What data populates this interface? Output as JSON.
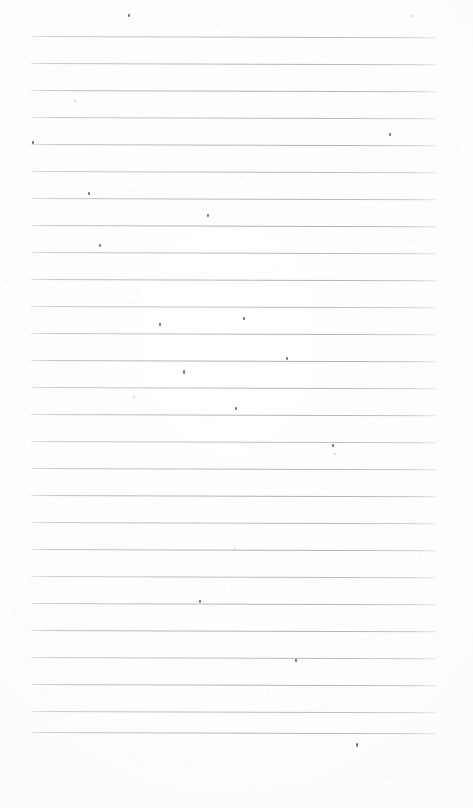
{
  "document": {
    "kind": "scanned-paper",
    "description": "Blank ruled writing paper, scanned",
    "text_content": "",
    "page_width": 473,
    "page_height": 808,
    "background_color": "#fdfdfd",
    "rule_color": "#b4b4bc",
    "ink_color": "#4a4a52"
  },
  "ruling": {
    "line_count": 26,
    "first_line_y": 36,
    "line_spacing": 27,
    "line_left_x": 31,
    "line_right_x": 436,
    "line_thickness": 1,
    "skew_degrees": 0.18,
    "lines_y": [
      36,
      63,
      90,
      117,
      144,
      171,
      198,
      225,
      252,
      279,
      306,
      333,
      360,
      387,
      414,
      441,
      468,
      495,
      522,
      549,
      576,
      603,
      630,
      657,
      684,
      711,
      732
    ]
  },
  "margins": {
    "top_margin_height": 36,
    "bottom_margin_height": 76,
    "left_margin_width": 31,
    "right_margin_width": 37
  },
  "specks": [
    {
      "x": 128,
      "y": 14,
      "size": 2.0,
      "tone": "dark"
    },
    {
      "x": 216,
      "y": 24,
      "size": 1.4,
      "tone": "faint"
    },
    {
      "x": 246,
      "y": 10,
      "size": 1.3,
      "tone": "faint"
    },
    {
      "x": 411,
      "y": 15,
      "size": 1.5,
      "tone": "faint"
    },
    {
      "x": 457,
      "y": 22,
      "size": 1.2,
      "tone": "faint"
    },
    {
      "x": 67,
      "y": 44,
      "size": 1.4,
      "tone": "faint"
    },
    {
      "x": 289,
      "y": 41,
      "size": 1.3,
      "tone": "faint"
    },
    {
      "x": 380,
      "y": 62,
      "size": 1.4,
      "tone": "faint"
    },
    {
      "x": 76,
      "y": 56,
      "size": 1.3,
      "tone": "faint"
    },
    {
      "x": 270,
      "y": 73,
      "size": 1.3,
      "tone": "faint"
    },
    {
      "x": 74,
      "y": 100,
      "size": 1.5,
      "tone": "faint"
    },
    {
      "x": 372,
      "y": 89,
      "size": 1.3,
      "tone": "faint"
    },
    {
      "x": 136,
      "y": 113,
      "size": 1.2,
      "tone": "faint"
    },
    {
      "x": 389,
      "y": 133,
      "size": 1.8,
      "tone": "dark"
    },
    {
      "x": 32,
      "y": 141,
      "size": 1.6,
      "tone": "dark"
    },
    {
      "x": 158,
      "y": 146,
      "size": 1.3,
      "tone": "faint"
    },
    {
      "x": 342,
      "y": 154,
      "size": 1.2,
      "tone": "faint"
    },
    {
      "x": 457,
      "y": 147,
      "size": 1.3,
      "tone": "faint"
    },
    {
      "x": 13,
      "y": 174,
      "size": 1.4,
      "tone": "faint"
    },
    {
      "x": 240,
      "y": 176,
      "size": 1.2,
      "tone": "faint"
    },
    {
      "x": 88,
      "y": 192,
      "size": 1.9,
      "tone": "dark"
    },
    {
      "x": 130,
      "y": 190,
      "size": 1.3,
      "tone": "faint"
    },
    {
      "x": 303,
      "y": 193,
      "size": 1.3,
      "tone": "faint"
    },
    {
      "x": 207,
      "y": 214,
      "size": 1.8,
      "tone": "dark"
    },
    {
      "x": 174,
      "y": 203,
      "size": 1.2,
      "tone": "faint"
    },
    {
      "x": 413,
      "y": 240,
      "size": 1.4,
      "tone": "faint"
    },
    {
      "x": 99,
      "y": 244,
      "size": 1.8,
      "tone": "dark"
    },
    {
      "x": 276,
      "y": 267,
      "size": 1.4,
      "tone": "faint"
    },
    {
      "x": 160,
      "y": 272,
      "size": 1.3,
      "tone": "faint"
    },
    {
      "x": 7,
      "y": 280,
      "size": 1.3,
      "tone": "faint"
    },
    {
      "x": 36,
      "y": 299,
      "size": 1.4,
      "tone": "faint"
    },
    {
      "x": 136,
      "y": 291,
      "size": 1.2,
      "tone": "faint"
    },
    {
      "x": 133,
      "y": 303,
      "size": 1.3,
      "tone": "faint"
    },
    {
      "x": 243,
      "y": 317,
      "size": 1.9,
      "tone": "dark"
    },
    {
      "x": 159,
      "y": 323,
      "size": 1.6,
      "tone": "dark"
    },
    {
      "x": 337,
      "y": 315,
      "size": 1.3,
      "tone": "faint"
    },
    {
      "x": 286,
      "y": 357,
      "size": 1.9,
      "tone": "dark"
    },
    {
      "x": 183,
      "y": 370,
      "size": 2.2,
      "tone": "dark"
    },
    {
      "x": 121,
      "y": 379,
      "size": 1.4,
      "tone": "faint"
    },
    {
      "x": 355,
      "y": 365,
      "size": 1.3,
      "tone": "faint"
    },
    {
      "x": 133,
      "y": 396,
      "size": 1.5,
      "tone": "faint"
    },
    {
      "x": 235,
      "y": 407,
      "size": 2.0,
      "tone": "dark"
    },
    {
      "x": 236,
      "y": 412,
      "size": 1.4,
      "tone": "faint"
    },
    {
      "x": 332,
      "y": 444,
      "size": 2.0,
      "tone": "dark"
    },
    {
      "x": 334,
      "y": 453,
      "size": 1.5,
      "tone": "faint"
    },
    {
      "x": 53,
      "y": 450,
      "size": 1.3,
      "tone": "faint"
    },
    {
      "x": 416,
      "y": 443,
      "size": 1.2,
      "tone": "faint"
    },
    {
      "x": 86,
      "y": 483,
      "size": 1.3,
      "tone": "faint"
    },
    {
      "x": 348,
      "y": 481,
      "size": 1.4,
      "tone": "faint"
    },
    {
      "x": 375,
      "y": 481,
      "size": 1.2,
      "tone": "faint"
    },
    {
      "x": 345,
      "y": 500,
      "size": 1.3,
      "tone": "faint"
    },
    {
      "x": 18,
      "y": 506,
      "size": 1.3,
      "tone": "faint"
    },
    {
      "x": 133,
      "y": 518,
      "size": 1.2,
      "tone": "faint"
    },
    {
      "x": 234,
      "y": 548,
      "size": 1.5,
      "tone": "faint"
    },
    {
      "x": 84,
      "y": 562,
      "size": 1.4,
      "tone": "faint"
    },
    {
      "x": 135,
      "y": 564,
      "size": 1.2,
      "tone": "faint"
    },
    {
      "x": 419,
      "y": 559,
      "size": 1.3,
      "tone": "faint"
    },
    {
      "x": 199,
      "y": 600,
      "size": 1.9,
      "tone": "dark"
    },
    {
      "x": 268,
      "y": 603,
      "size": 1.3,
      "tone": "faint"
    },
    {
      "x": 300,
      "y": 593,
      "size": 1.2,
      "tone": "faint"
    },
    {
      "x": 15,
      "y": 611,
      "size": 1.3,
      "tone": "faint"
    },
    {
      "x": 373,
      "y": 621,
      "size": 1.4,
      "tone": "faint"
    },
    {
      "x": 96,
      "y": 658,
      "size": 1.4,
      "tone": "faint"
    },
    {
      "x": 164,
      "y": 667,
      "size": 1.3,
      "tone": "faint"
    },
    {
      "x": 295,
      "y": 659,
      "size": 1.9,
      "tone": "dark"
    },
    {
      "x": 41,
      "y": 691,
      "size": 1.3,
      "tone": "faint"
    },
    {
      "x": 267,
      "y": 695,
      "size": 1.2,
      "tone": "faint"
    },
    {
      "x": 356,
      "y": 743,
      "size": 2.2,
      "tone": "dark"
    },
    {
      "x": 128,
      "y": 753,
      "size": 1.4,
      "tone": "faint"
    },
    {
      "x": 143,
      "y": 765,
      "size": 1.3,
      "tone": "faint"
    },
    {
      "x": 190,
      "y": 766,
      "size": 1.2,
      "tone": "faint"
    },
    {
      "x": 278,
      "y": 787,
      "size": 1.3,
      "tone": "faint"
    },
    {
      "x": 389,
      "y": 776,
      "size": 1.2,
      "tone": "faint"
    }
  ]
}
